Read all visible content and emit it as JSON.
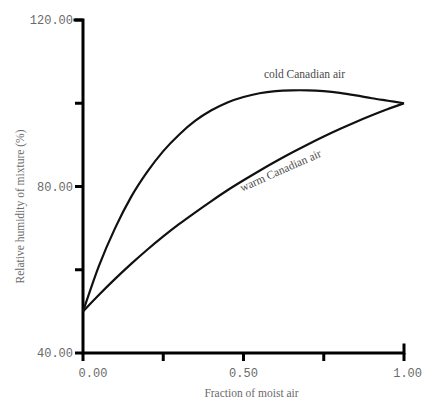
{
  "chart_data": {
    "type": "line",
    "title": "",
    "xlabel": "Fraction of moist air",
    "ylabel": "Relative humidity of mixture (%)",
    "xlim": [
      0.0,
      1.0
    ],
    "ylim": [
      40.0,
      120.0
    ],
    "x_ticks": [
      0.0,
      0.25,
      0.5,
      0.75,
      1.0
    ],
    "x_tick_labels": [
      "0.00",
      "",
      "0.50",
      "",
      "1.00"
    ],
    "y_ticks": [
      40.0,
      60.0,
      80.0,
      100.0,
      120.0
    ],
    "y_tick_labels": [
      "40.00",
      "",
      "80.00",
      "",
      "120.00"
    ],
    "grid": false,
    "legend": "none (curves labeled inline)",
    "x": [
      0.0,
      0.05,
      0.1,
      0.15,
      0.2,
      0.25,
      0.3,
      0.35,
      0.4,
      0.45,
      0.5,
      0.55,
      0.6,
      0.65,
      0.7,
      0.75,
      0.8,
      0.85,
      0.9,
      0.95,
      1.0
    ],
    "series": [
      {
        "name": "cold Canadian air",
        "values": [
          50.0,
          61.0,
          70.0,
          77.5,
          83.5,
          88.5,
          92.5,
          95.8,
          98.3,
          100.2,
          101.5,
          102.4,
          102.9,
          103.1,
          103.1,
          102.9,
          102.5,
          101.9,
          101.2,
          100.6,
          100.0
        ]
      },
      {
        "name": "warm Canadian air",
        "values": [
          50.0,
          54.0,
          57.8,
          61.4,
          64.8,
          68.0,
          71.0,
          73.8,
          76.5,
          79.1,
          81.5,
          83.8,
          86.0,
          88.1,
          90.1,
          92.0,
          93.8,
          95.5,
          97.1,
          98.6,
          100.0
        ]
      }
    ],
    "annotations": [
      {
        "text": "cold Canadian air",
        "x": 0.69,
        "y": 106,
        "rotation": 0
      },
      {
        "text": "warm Canadian air",
        "x": 0.62,
        "y": 83,
        "rotation": -24
      }
    ]
  }
}
